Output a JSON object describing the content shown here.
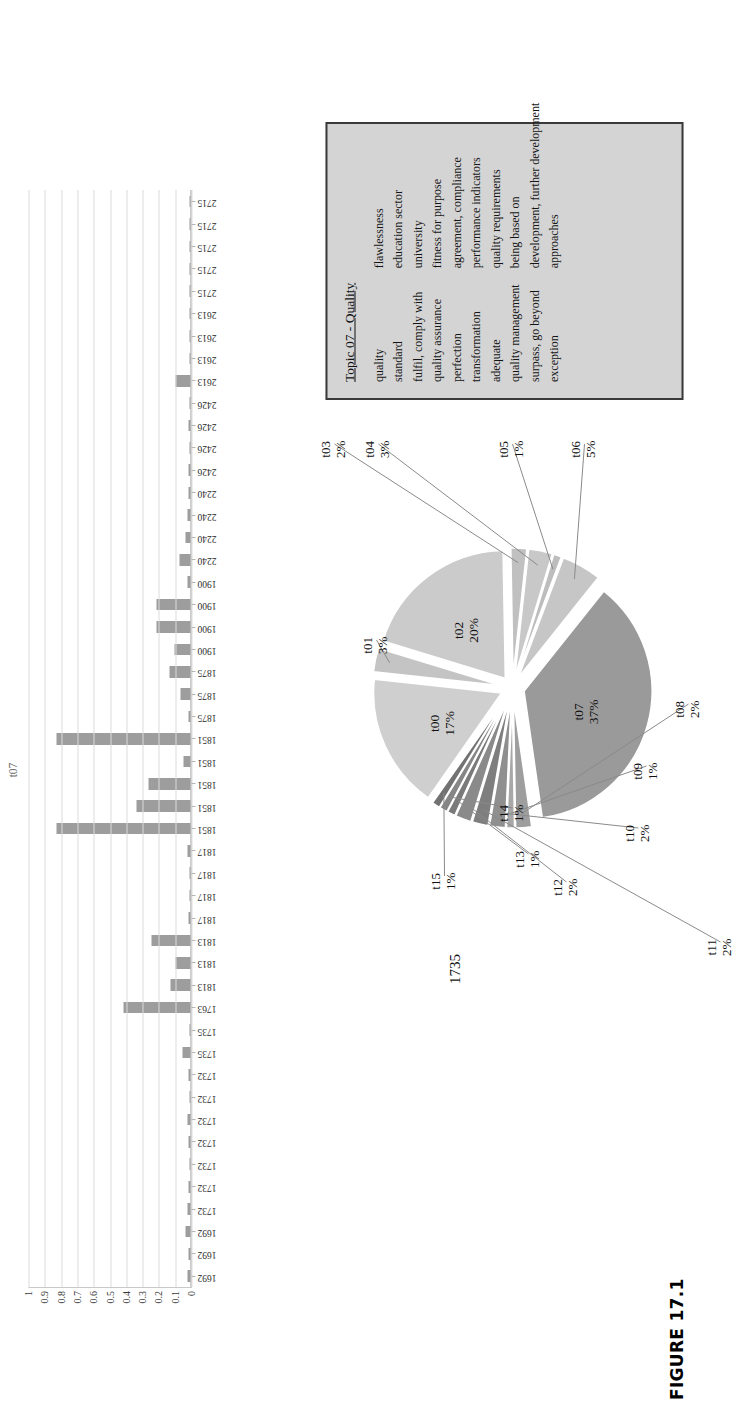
{
  "figure": {
    "caption": "FIGURE 17.1"
  },
  "chart_data": [
    {
      "type": "bar",
      "name": "topic-t07-document-distribution",
      "title": "t07",
      "xlabel": "",
      "ylabel": "",
      "ylim": [
        0,
        1
      ],
      "grid": true,
      "ytick_labels": [
        "0",
        "0.1",
        "0.2",
        "0.3",
        "0.4",
        "0.5",
        "0.6",
        "0.7",
        "0.8",
        "0.9",
        "1"
      ],
      "ytick_values": [
        0,
        0.1,
        0.2,
        0.3,
        0.4,
        0.5,
        0.6,
        0.7,
        0.8,
        0.9,
        1
      ],
      "categories": [
        "1692",
        "1692",
        "1692",
        "1732",
        "1732",
        "1732",
        "1732",
        "1732",
        "1732",
        "1732",
        "1735",
        "1735",
        "1763",
        "1813",
        "1813",
        "1813",
        "1817",
        "1817",
        "1817",
        "1817",
        "1851",
        "1851",
        "1851",
        "1851",
        "1851",
        "1875",
        "1875",
        "1875",
        "1900",
        "1900",
        "1900",
        "1900",
        "2240",
        "2240",
        "2240",
        "2240",
        "2426",
        "2426",
        "2426",
        "2426",
        "2613",
        "2613",
        "2613",
        "2613",
        "2715",
        "2715",
        "2715",
        "2715",
        "2715"
      ],
      "values": [
        0.02,
        0.01,
        0.03,
        0.02,
        0.01,
        0.0,
        0.01,
        0.02,
        0.0,
        0.01,
        0.05,
        0.0,
        0.41,
        0.12,
        0.09,
        0.24,
        0.01,
        0.0,
        0.0,
        0.02,
        0.82,
        0.33,
        0.26,
        0.04,
        0.82,
        0.01,
        0.06,
        0.13,
        0.1,
        0.21,
        0.21,
        0.02,
        0.07,
        0.03,
        0.02,
        0.01,
        0.01,
        0.0,
        0.01,
        0.0,
        0.09,
        0.0,
        0.0,
        0.0,
        0.0,
        0.0,
        0.0,
        0.0,
        0.0
      ]
    },
    {
      "type": "pie",
      "name": "topic-distribution-pie",
      "title": "",
      "total_label": "1735",
      "legend_position": "callout-labels",
      "labels": [
        "t00",
        "t01",
        "t02",
        "t03",
        "t04",
        "t05",
        "t06",
        "t07",
        "t08",
        "t09",
        "t10",
        "t11",
        "t12",
        "t13",
        "t14",
        "t15"
      ],
      "values": [
        17,
        3,
        20,
        2,
        3,
        1,
        5,
        37,
        2,
        1,
        2,
        2,
        2,
        1,
        1,
        1
      ],
      "percent_labels": [
        "17%",
        "3%",
        "20%",
        "2%",
        "3%",
        "1%",
        "5%",
        "37%",
        "2%",
        "1%",
        "2%",
        "2%",
        "2%",
        "1%",
        "1%",
        "1%"
      ],
      "colors": [
        "#cfcfcf",
        "#c4c4c4",
        "#cbcbcb",
        "#c0c0c0",
        "#c8c8c8",
        "#bdbdbd",
        "#c6c6c6",
        "#9a9a9a",
        "#9e9e9e",
        "#a8a8a8",
        "#8f8f8f",
        "#7e7e7e",
        "#8a8a8a",
        "#7a7a7a",
        "#868686",
        "#727272"
      ]
    }
  ],
  "topic_box": {
    "title": "Topic 07 - Quality",
    "left_terms": [
      "quality",
      "standard",
      "fulfil, comply with",
      "quality assurance",
      "perfection",
      "transformation",
      "adequate",
      "quality management",
      "surpass, go beyond",
      "exception"
    ],
    "right_terms": [
      "flawlessness",
      "education sector",
      "university",
      "fitness for purpose",
      "agreement, compliance",
      "performance indicators",
      "quality requirements",
      "being based on",
      "development, further development",
      "approaches"
    ]
  }
}
